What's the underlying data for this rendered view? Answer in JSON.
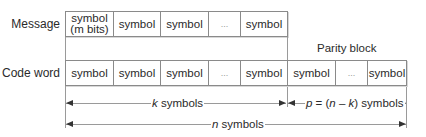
{
  "diagram": {
    "type": "block-code-structure",
    "rows": {
      "message": {
        "label": "Message",
        "cells": [
          {
            "line1": "symbol",
            "line2": "(m bits)"
          },
          {
            "line1": "symbol"
          },
          {
            "line1": "symbol"
          },
          {
            "line1": "..."
          },
          {
            "line1": "symbol"
          }
        ]
      },
      "codeword": {
        "label": "Code word",
        "cells": [
          "symbol",
          "symbol",
          "symbol",
          "...",
          "symbol",
          "symbol",
          "...",
          "symbol"
        ]
      }
    },
    "parity_label": "Parity block",
    "arrows": {
      "k": {
        "var": "k",
        "text": " symbols"
      },
      "p": {
        "var1": "p",
        "mid1": " = (",
        "var2": "n",
        "mid2": " – ",
        "var3": "k",
        "end": ") symbols"
      },
      "n": {
        "var": "n",
        "text": " symbols"
      }
    },
    "colors": {
      "border": "#8a8a8a",
      "text": "#2a2a2a",
      "line": "#9a9a9a",
      "arrowhead": "#333333"
    }
  }
}
